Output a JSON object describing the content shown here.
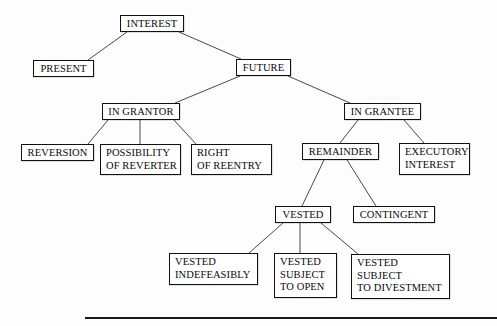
{
  "diagram": {
    "type": "tree",
    "line_color": "#333333",
    "box_border_color": "#111111",
    "background": "#fdfdfd",
    "nodes": [
      {
        "id": "interest",
        "label": "INTEREST",
        "x": 120,
        "y": 15,
        "w": 64,
        "h": 17,
        "align": "center"
      },
      {
        "id": "present",
        "label": "PRESENT",
        "x": 33,
        "y": 60,
        "w": 61,
        "h": 17,
        "align": "center"
      },
      {
        "id": "future",
        "label": "FUTURE",
        "x": 236,
        "y": 59,
        "w": 55,
        "h": 17,
        "align": "center"
      },
      {
        "id": "in-grantor",
        "label": "IN GRANTOR",
        "x": 102,
        "y": 103,
        "w": 78,
        "h": 17,
        "align": "center"
      },
      {
        "id": "in-grantee",
        "label": "IN GRANTEE",
        "x": 344,
        "y": 103,
        "w": 77,
        "h": 17,
        "align": "center"
      },
      {
        "id": "reversion",
        "label": "REVERSION",
        "x": 21,
        "y": 144,
        "w": 73,
        "h": 17,
        "align": "center"
      },
      {
        "id": "possibility",
        "label": "POSSIBILITY\nOF REVERTER",
        "x": 100,
        "y": 144,
        "w": 81,
        "h": 31,
        "align": "left"
      },
      {
        "id": "right-reentry",
        "label": "RIGHT\nOF REENTRY",
        "x": 191,
        "y": 144,
        "w": 81,
        "h": 31,
        "align": "left"
      },
      {
        "id": "remainder",
        "label": "REMAINDER",
        "x": 302,
        "y": 143,
        "w": 77,
        "h": 17,
        "align": "center"
      },
      {
        "id": "executory-interest",
        "label": "EXECUTORY\nINTEREST",
        "x": 399,
        "y": 143,
        "w": 71,
        "h": 32,
        "align": "left"
      },
      {
        "id": "vested",
        "label": "VESTED",
        "x": 275,
        "y": 206,
        "w": 56,
        "h": 17,
        "align": "center"
      },
      {
        "id": "contingent",
        "label": "CONTINGENT",
        "x": 353,
        "y": 206,
        "w": 82,
        "h": 17,
        "align": "center"
      },
      {
        "id": "vested-indefeasibly",
        "label": "VESTED\nINDEFEASIBLY",
        "x": 169,
        "y": 253,
        "w": 89,
        "h": 32,
        "align": "left"
      },
      {
        "id": "vested-open",
        "label": "VESTED\nSUBJECT\nTO OPEN",
        "x": 274,
        "y": 253,
        "w": 63,
        "h": 45,
        "align": "left"
      },
      {
        "id": "vested-divestment",
        "label": "VESTED\nSUBJECT\nTO DIVESTMENT",
        "x": 351,
        "y": 254,
        "w": 99,
        "h": 45,
        "align": "left"
      }
    ],
    "edges": [
      {
        "from": "interest",
        "to": "present",
        "x1": 127,
        "y1": 32,
        "x2": 88,
        "y2": 60
      },
      {
        "from": "interest",
        "to": "future",
        "x1": 179,
        "y1": 32,
        "x2": 241,
        "y2": 59
      },
      {
        "from": "future",
        "to": "in-grantor",
        "x1": 240,
        "y1": 76,
        "x2": 175,
        "y2": 103
      },
      {
        "from": "future",
        "to": "in-grantee",
        "x1": 288,
        "y1": 76,
        "x2": 350,
        "y2": 103
      },
      {
        "from": "in-grantor",
        "to": "reversion",
        "x1": 108,
        "y1": 120,
        "x2": 88,
        "y2": 144
      },
      {
        "from": "in-grantor",
        "to": "possibility",
        "x1": 140,
        "y1": 120,
        "x2": 140,
        "y2": 144
      },
      {
        "from": "in-grantor",
        "to": "right-reentry",
        "x1": 174,
        "y1": 120,
        "x2": 196,
        "y2": 144
      },
      {
        "from": "in-grantee",
        "to": "remainder",
        "x1": 358,
        "y1": 120,
        "x2": 340,
        "y2": 143
      },
      {
        "from": "in-grantee",
        "to": "executory-interest",
        "x1": 404,
        "y1": 120,
        "x2": 424,
        "y2": 143
      },
      {
        "from": "remainder",
        "to": "vested",
        "x1": 324,
        "y1": 160,
        "x2": 302,
        "y2": 206
      },
      {
        "from": "remainder",
        "to": "contingent",
        "x1": 347,
        "y1": 160,
        "x2": 376,
        "y2": 206
      },
      {
        "from": "vested",
        "to": "vested-indefeasibly",
        "x1": 283,
        "y1": 223,
        "x2": 249,
        "y2": 253
      },
      {
        "from": "vested",
        "to": "vested-open",
        "x1": 300,
        "y1": 223,
        "x2": 300,
        "y2": 253
      },
      {
        "from": "vested",
        "to": "vested-divestment",
        "x1": 321,
        "y1": 223,
        "x2": 358,
        "y2": 254
      }
    ],
    "footer_rule": {
      "x": 85,
      "y": 317,
      "w": 412,
      "h": 2
    }
  }
}
